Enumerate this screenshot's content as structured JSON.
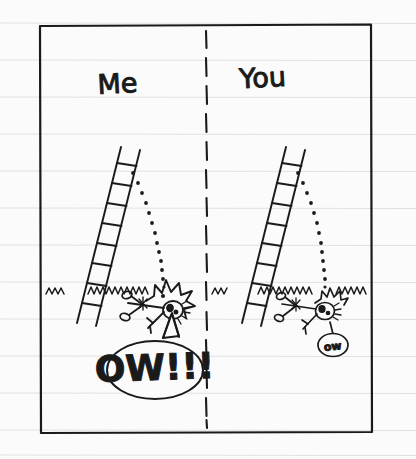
{
  "page": {
    "medium": "ruled notebook paper",
    "paper_color": "#fbfbfb",
    "rule_color": "#d9dde4",
    "ink_color": "#1a1a1a",
    "width": 416,
    "height": 459,
    "ruled_lines": {
      "count": 13,
      "first_y": 23,
      "spacing": 37
    },
    "border_box": {
      "x": 40,
      "y": 24,
      "width": 332,
      "height": 409
    },
    "divider": {
      "name": "panel-divider",
      "style": "dashed",
      "x": 206,
      "y_top": 30,
      "y_bottom": 428
    }
  },
  "panels": [
    {
      "id": "left",
      "label": "Me",
      "label_x": 118,
      "label_y": 92,
      "ladder": {
        "top_x": 121,
        "top_y": 148,
        "bottom_x": 78,
        "bottom_y": 322,
        "width": 20,
        "rungs": 9
      },
      "trajectory": {
        "name": "fall-arc",
        "style": "dotted",
        "dots": 15,
        "start_x": 133,
        "start_y": 172,
        "end_x": 163,
        "end_y": 286
      },
      "ground_grass": [
        {
          "x": 46,
          "y": 291,
          "w": 18
        },
        {
          "x": 88,
          "y": 291,
          "w": 62
        }
      ],
      "figure": {
        "name": "fallen-stick-figure",
        "head_x": 172,
        "head_y": 309,
        "pose": "sprawled on back",
        "expression": "x-eyes dizzy"
      },
      "impact": {
        "name": "impact-burst",
        "x": 168,
        "y": 296,
        "size": "large",
        "spikes": 9
      },
      "speech": {
        "text": "OW!!!",
        "bubble": {
          "cx": 155,
          "cy": 370,
          "rx": 47,
          "ry": 28
        },
        "tail": {
          "x": 172,
          "y": 340
        },
        "emphasis": "shouting"
      }
    },
    {
      "id": "right",
      "label": "You",
      "label_x": 262,
      "label_y": 86,
      "ladder": {
        "top_x": 286,
        "top_y": 148,
        "bottom_x": 243,
        "bottom_y": 322,
        "width": 20,
        "rungs": 9
      },
      "trajectory": {
        "name": "fall-arc",
        "style": "dotted",
        "dots": 15,
        "start_x": 298,
        "start_y": 172,
        "end_x": 322,
        "end_y": 286
      },
      "ground_grass": [
        {
          "x": 212,
          "y": 291,
          "w": 16
        },
        {
          "x": 258,
          "y": 291,
          "w": 58
        },
        {
          "x": 336,
          "y": 291,
          "w": 28
        }
      ],
      "figure": {
        "name": "fallen-stick-figure",
        "head_x": 325,
        "head_y": 310,
        "pose": "sprawled on back",
        "expression": "x-eyes dizzy"
      },
      "impact": {
        "name": "impact-burst",
        "x": 327,
        "y": 299,
        "size": "small",
        "spikes": 7
      },
      "speech": {
        "text": "ow",
        "bubble": {
          "cx": 332,
          "cy": 345,
          "rx": 14,
          "ry": 11
        },
        "tail": {
          "x": 329,
          "y": 327
        },
        "emphasis": "quiet"
      }
    }
  ]
}
